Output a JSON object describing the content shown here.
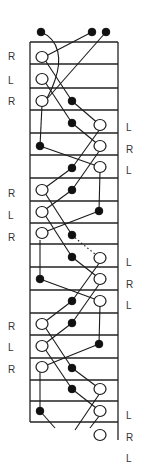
{
  "diagram": {
    "type": "hand-drawn knitting/braid grid diagram",
    "grid": {
      "left_x": 30,
      "right_x": 118,
      "right_line_bottom": 440,
      "row_lines_y": [
        42,
        64,
        88,
        110,
        133,
        155,
        178,
        201,
        223,
        244,
        267,
        290,
        313,
        335,
        358,
        380,
        401,
        422
      ]
    },
    "left_labels": [
      {
        "text": "R",
        "y": 56
      },
      {
        "text": "L",
        "y": 80
      },
      {
        "text": "R",
        "y": 101
      },
      {
        "text": "R",
        "y": 193
      },
      {
        "text": "L",
        "y": 215
      },
      {
        "text": "R",
        "y": 237
      },
      {
        "text": "R",
        "y": 326
      },
      {
        "text": "L",
        "y": 347
      },
      {
        "text": "R",
        "y": 369
      }
    ],
    "right_labels": [
      {
        "text": "L",
        "y": 127
      },
      {
        "text": "R",
        "y": 149
      },
      {
        "text": "L",
        "y": 170
      },
      {
        "text": "L",
        "y": 262
      },
      {
        "text": "R",
        "y": 284
      },
      {
        "text": "L",
        "y": 305
      },
      {
        "text": "L",
        "y": 415
      },
      {
        "text": "R",
        "y": 437
      },
      {
        "text": "L",
        "y": 458
      }
    ],
    "open_nodes": [
      [
        42,
        57
      ],
      [
        42,
        79
      ],
      [
        42,
        101
      ],
      [
        100,
        125
      ],
      [
        100,
        146
      ],
      [
        100,
        167
      ],
      [
        42,
        190
      ],
      [
        42,
        212
      ],
      [
        42,
        233
      ],
      [
        100,
        258
      ],
      [
        100,
        279
      ],
      [
        100,
        301
      ],
      [
        42,
        324
      ],
      [
        42,
        346
      ],
      [
        42,
        367
      ],
      [
        100,
        389
      ],
      [
        100,
        411
      ],
      [
        100,
        435
      ]
    ],
    "filled_nodes": [
      [
        41,
        32
      ],
      [
        92,
        32
      ],
      [
        106,
        32
      ],
      [
        72,
        101
      ],
      [
        72,
        123
      ],
      [
        40,
        146
      ],
      [
        72,
        168
      ],
      [
        72,
        190
      ],
      [
        99,
        211
      ],
      [
        72,
        235
      ],
      [
        72,
        257
      ],
      [
        40,
        279
      ],
      [
        72,
        301
      ],
      [
        72,
        323
      ],
      [
        99,
        344
      ],
      [
        72,
        368
      ],
      [
        72,
        389
      ],
      [
        40,
        411
      ]
    ],
    "edges": [
      {
        "d": "M41,32 C60,40 62,60 55,80 C52,90 48,96 46,100"
      },
      {
        "d": "M92,32 L46,56"
      },
      {
        "d": "M106,32 L46,100"
      },
      {
        "d": "M45,60 L72,101"
      },
      {
        "d": "M45,82 L72,123"
      },
      {
        "d": "M72,101 L100,125"
      },
      {
        "d": "M42,105 L40,146"
      },
      {
        "d": "M72,123 L100,146"
      },
      {
        "d": "M40,146 L100,167"
      },
      {
        "d": "M72,168 L100,129"
      },
      {
        "d": "M72,190 L100,150"
      },
      {
        "d": "M72,168 L42,190"
      },
      {
        "d": "M100,171 L99,211"
      },
      {
        "d": "M99,211 L42,233"
      },
      {
        "d": "M45,193 L72,235"
      },
      {
        "d": "M45,215 L72,257"
      },
      {
        "d": "M72,190 L42,212"
      },
      {
        "d": "M40,240 L40,279"
      },
      {
        "d": "M72,235 L80,242 L100,258",
        "dashed": true
      },
      {
        "d": "M72,257 L100,279"
      },
      {
        "d": "M40,279 L100,301"
      },
      {
        "d": "M72,301 L100,262"
      },
      {
        "d": "M72,323 L100,283"
      },
      {
        "d": "M72,301 L42,324"
      },
      {
        "d": "M100,305 L99,344"
      },
      {
        "d": "M99,344 L42,367"
      },
      {
        "d": "M45,327 L72,368"
      },
      {
        "d": "M45,349 L72,389"
      },
      {
        "d": "M72,323 L42,346"
      },
      {
        "d": "M40,371 L40,411"
      },
      {
        "d": "M72,368 L100,389"
      },
      {
        "d": "M72,389 L100,411"
      },
      {
        "d": "M40,411 L55,428"
      },
      {
        "d": "M100,393 L75,430"
      },
      {
        "d": "M100,415 L90,428"
      }
    ],
    "colors": {
      "ink": "#1a1a1a",
      "paper": "#ffffff",
      "label": "#333333"
    }
  }
}
